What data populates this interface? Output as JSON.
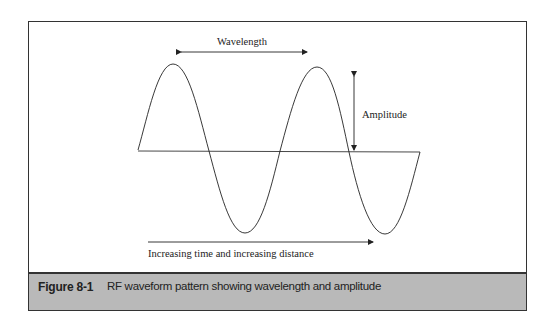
{
  "figure": {
    "number": "Figure 8-1",
    "caption": "RF waveform pattern showing wavelength and amplitude"
  },
  "labels": {
    "wavelength": "Wavelength",
    "amplitude": "Amplitude",
    "direction": "Increasing time and increasing distance"
  },
  "colors": {
    "line": "#222222",
    "caption_band": "#b9b9b9",
    "border": "#333333"
  }
}
